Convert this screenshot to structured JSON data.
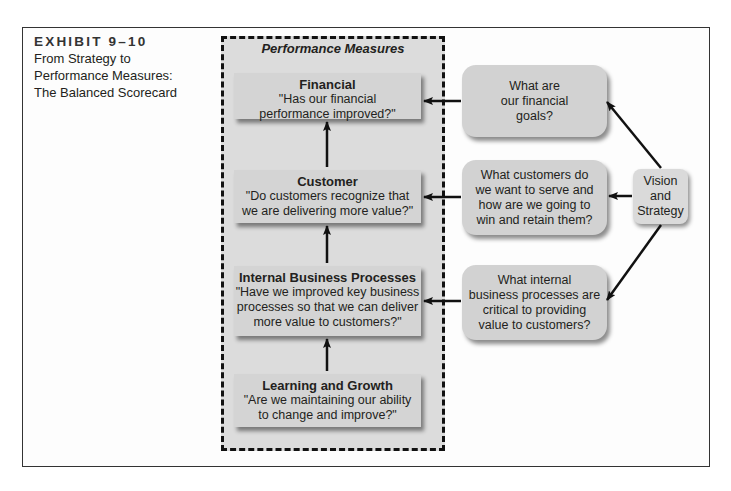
{
  "exhibit": {
    "number": "EXHIBIT 9–10",
    "title_lines": [
      "From Strategy to",
      "Performance Measures:",
      "The Balanced Scorecard"
    ]
  },
  "performance_measures": {
    "title": "Performance Measures",
    "boxes": [
      {
        "heading": "Financial",
        "lines": [
          "\"Has our financial",
          "performance improved?\""
        ]
      },
      {
        "heading": "Customer",
        "lines": [
          "\"Do customers recognize that",
          "we are delivering more value?\""
        ]
      },
      {
        "heading": "Internal Business Processes",
        "lines": [
          "\"Have we improved key business",
          "processes so that we can deliver",
          "more value to customers?\""
        ]
      },
      {
        "heading": "Learning and Growth",
        "lines": [
          "\"Are we maintaining our ability",
          "to change and improve?\""
        ]
      }
    ]
  },
  "questions": [
    {
      "lines": [
        "What are",
        "our financial",
        "goals?"
      ]
    },
    {
      "lines": [
        "What customers do",
        "we want to serve and",
        "how are we going to",
        "win and retain them?"
      ]
    },
    {
      "lines": [
        "What internal",
        "business processes are",
        "critical to providing",
        "value to customers?"
      ]
    }
  ],
  "vision": {
    "lines": [
      "Vision",
      "and",
      "Strategy"
    ]
  }
}
